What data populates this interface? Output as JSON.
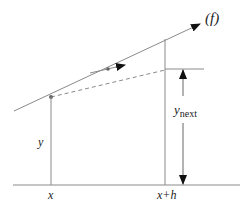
{
  "diagram": {
    "colors": {
      "line": "#8a8a8a",
      "ink": "#222222",
      "background": "#ffffff"
    },
    "labels": {
      "function": "(f)",
      "y": "y",
      "y_next_base": "y",
      "y_next_sub": "next",
      "x": "x",
      "x_plus_h": "x+h"
    },
    "elements": [
      {
        "type": "tangent-line-with-arrow",
        "label": "(f)"
      },
      {
        "type": "slope-indicator-arrow"
      },
      {
        "type": "dashed-chord"
      },
      {
        "type": "vertical-line-at-x"
      },
      {
        "type": "vertical-line-at-x-plus-h"
      },
      {
        "type": "double-arrow-y-next"
      },
      {
        "type": "baseline"
      }
    ]
  }
}
